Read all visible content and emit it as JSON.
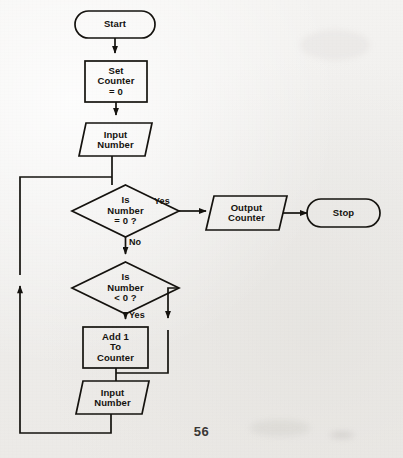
{
  "document": {
    "kind": "scanned-book-page",
    "page_number": "56",
    "title": "Counting Flowchart",
    "paper_color": "#efeeec",
    "ink_color": "#15130f"
  },
  "diagram": {
    "type": "flowchart",
    "nodes": [
      {
        "id": "start",
        "shape": "terminator",
        "label": "Start",
        "x": 75,
        "y": 11,
        "w": 80,
        "h": 27
      },
      {
        "id": "set-counter",
        "shape": "process",
        "label": "Set\nCounter\n= 0",
        "x": 85,
        "y": 61,
        "w": 62,
        "h": 41
      },
      {
        "id": "input-number-1",
        "shape": "input-output",
        "label": "Input\nNumber",
        "x": 79,
        "y": 123,
        "w": 73,
        "h": 33
      },
      {
        "id": "is-number-zero",
        "shape": "decision",
        "label": "Is\nNumber\n= 0 ?",
        "x": 72,
        "y": 185,
        "w": 107,
        "h": 52
      },
      {
        "id": "output-counter",
        "shape": "input-output",
        "label": "Output\nCounter",
        "x": 206,
        "y": 196,
        "w": 81,
        "h": 34
      },
      {
        "id": "stop",
        "shape": "terminator",
        "label": "Stop",
        "x": 307,
        "y": 199,
        "w": 73,
        "h": 28
      },
      {
        "id": "is-number-negative",
        "shape": "decision",
        "label": "Is\nNumber\n< 0 ?",
        "x": 72,
        "y": 262,
        "w": 107,
        "h": 52
      },
      {
        "id": "add-one",
        "shape": "process",
        "label": "Add 1\nTo\nCounter",
        "x": 83,
        "y": 327,
        "w": 65,
        "h": 41
      },
      {
        "id": "input-number-2",
        "shape": "input-output",
        "label": "Input\nNumber",
        "x": 76,
        "y": 381,
        "w": 73,
        "h": 33
      }
    ],
    "edges": [
      {
        "id": "start-to-set-counter",
        "from": "start",
        "to": "set-counter",
        "label": ""
      },
      {
        "id": "set-counter-to-input-1",
        "from": "set-counter",
        "to": "input-number-1",
        "label": ""
      },
      {
        "id": "input-1-to-decision-1",
        "from": "input-number-1",
        "to": "is-number-zero",
        "label": ""
      },
      {
        "id": "decision-1-yes",
        "from": "is-number-zero",
        "to": "output-counter",
        "label": "Yes",
        "label_x": 154,
        "label_y": 194
      },
      {
        "id": "decision-1-no",
        "from": "is-number-zero",
        "to": "is-number-negative",
        "label": "No",
        "label_x": 130,
        "label_y": 240
      },
      {
        "id": "output-to-stop",
        "from": "output-counter",
        "to": "stop",
        "label": ""
      },
      {
        "id": "decision-2-yes",
        "from": "is-number-negative",
        "to": "add-one",
        "label": "Yes",
        "label_x": 130,
        "label_y": 314
      },
      {
        "id": "decision-2-no",
        "from": "is-number-negative",
        "to": "input-number-2",
        "label": "",
        "label_x": 0,
        "label_y": 0
      },
      {
        "id": "add-one-to-input-2",
        "from": "add-one",
        "to": "input-number-2",
        "label": ""
      },
      {
        "id": "loop-back",
        "from": "input-number-2",
        "to": "input-1-to-decision-1",
        "label": ""
      }
    ]
  }
}
